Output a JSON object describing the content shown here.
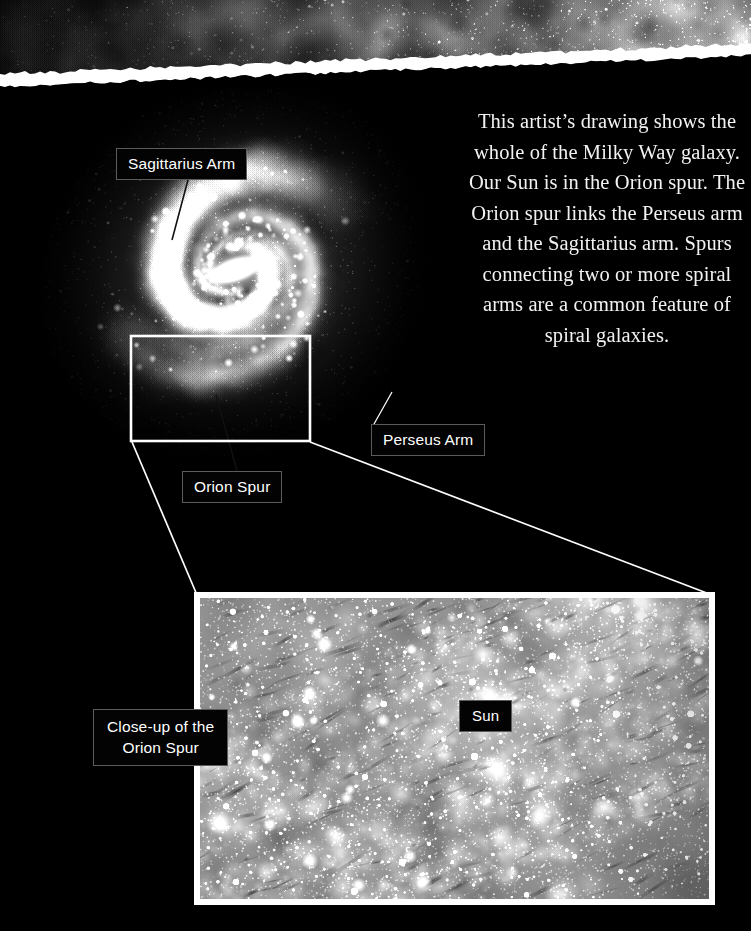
{
  "page": {
    "width": 751,
    "height": 931,
    "background_color": "#000000",
    "kind": "astronomy-infographic"
  },
  "colors": {
    "page_background": "#000000",
    "text": "#f2f2f2",
    "label_background": "#030303",
    "label_border": "#5c5c5c",
    "label_text": "#ffffff",
    "callout_line": "#ffffff",
    "selection_rect": "#ffffff",
    "torn_paper": "#ffffff",
    "panel_frame": "#ffffff"
  },
  "intro": {
    "text": "This artist’s drawing shows the whole of the Milky Way galaxy. Our Sun is in the Orion spur. The Orion spur links the Perseus arm and the Sagittarius arm. Spurs connecting two or more spiral arms are a common feature of spiral galaxies."
  },
  "labels": {
    "sagittarius_arm": "Sagittarius Arm",
    "perseus_arm": "Perseus Arm",
    "orion_spur": "Orion Spur",
    "closeup_orion_spur": "Close-up of the\nOrion Spur",
    "sun": "Sun"
  },
  "figures": {
    "top_strip": {
      "name": "nebula-strip",
      "description": "dark grayscale nebula band across the top, torn white paper edge below"
    },
    "galaxy": {
      "name": "milky-way-barred-spiral",
      "description": "artist rendering of the whole Milky Way galaxy seen face-on",
      "arms": 4,
      "center_x": 235,
      "center_y": 270,
      "bar_angle_deg": 35
    },
    "selection_rect": {
      "name": "orion-spur-selection",
      "x": 131,
      "y": 336,
      "width": 179,
      "height": 105
    },
    "closeup_panel": {
      "name": "orion-spur-closeup",
      "description": "magnified starfield view of the Orion spur with the Sun marked",
      "x": 194,
      "y": 592,
      "width": 521,
      "height": 313
    }
  },
  "chart_data": {
    "type": "diagram",
    "annotations": [
      {
        "label": "Sagittarius Arm",
        "target": "inner spiral arm, upper-left of galactic bar"
      },
      {
        "label": "Perseus Arm",
        "target": "outer spiral arm, lower-right of galaxy"
      },
      {
        "label": "Orion Spur",
        "target": "spur inside the selection rectangle"
      },
      {
        "label": "Close-up of the Orion Spur",
        "target": "magnified panel"
      },
      {
        "label": "Sun",
        "target": "position of the Sun within the Orion spur"
      }
    ]
  }
}
